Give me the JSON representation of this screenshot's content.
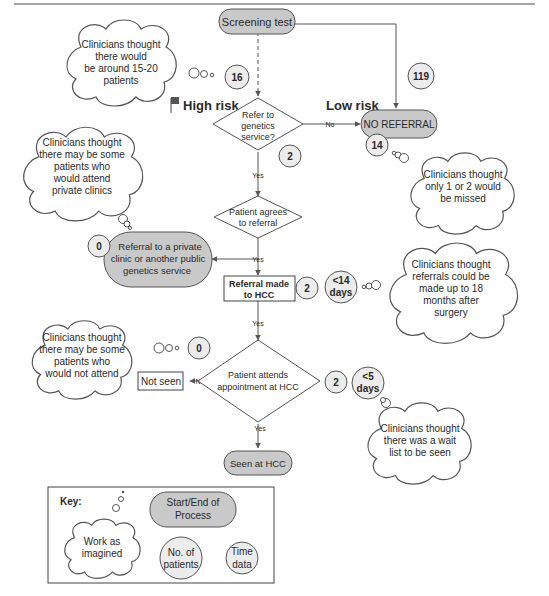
{
  "nodes": {
    "screening": "Screening test",
    "refer_q": [
      "Refer to",
      "genetics",
      "service?"
    ],
    "no_referral": "NO REFERRAL",
    "agrees": [
      "Patient agrees",
      "to referral"
    ],
    "private": [
      "Referral to a private",
      "clinic or another public",
      "genetics service"
    ],
    "referral_made": [
      "Referral made",
      "to HCC"
    ],
    "attends": [
      "Patient attends",
      "appointment at HCC"
    ],
    "not_seen": "Not seen",
    "seen": "Seen at HCC"
  },
  "labels": {
    "high_risk": "High risk",
    "low_risk": "Low risk",
    "no": "No",
    "yes": "Yes"
  },
  "counts": {
    "high_risk": "16",
    "low_risk": "119",
    "refer_q": "2",
    "no_referral": "14",
    "private": "0",
    "referral_made": "2",
    "not_seen": "0",
    "attends": "2"
  },
  "times": {
    "referral": [
      "<14",
      "days"
    ],
    "appointment": [
      "<5",
      "days"
    ]
  },
  "clouds": {
    "c1": [
      "Clinicians thought",
      "there would",
      "be around 15-20",
      "patients"
    ],
    "c2": [
      "Clinicians thought",
      "there may be some",
      "patients who",
      "would attend",
      "private clinics"
    ],
    "c3": [
      "Clinicians thought",
      "only 1 or 2 would",
      "be missed"
    ],
    "c4": [
      "Clinicians thought",
      "referrals could be",
      "made up to 18",
      "months after",
      "surgery"
    ],
    "c5": [
      "Clinicians thought",
      "there may be some",
      "patients who",
      "would not attend"
    ],
    "c6": [
      "Clinicians thought",
      "there was a wait",
      "list to be seen"
    ]
  },
  "key": {
    "title": "Key:",
    "imagined": [
      "Work as",
      "imagined"
    ],
    "start_end": [
      "Start/End of",
      "Process"
    ],
    "patients": [
      "No. of",
      "patients"
    ],
    "time": [
      "Time",
      "data"
    ]
  }
}
